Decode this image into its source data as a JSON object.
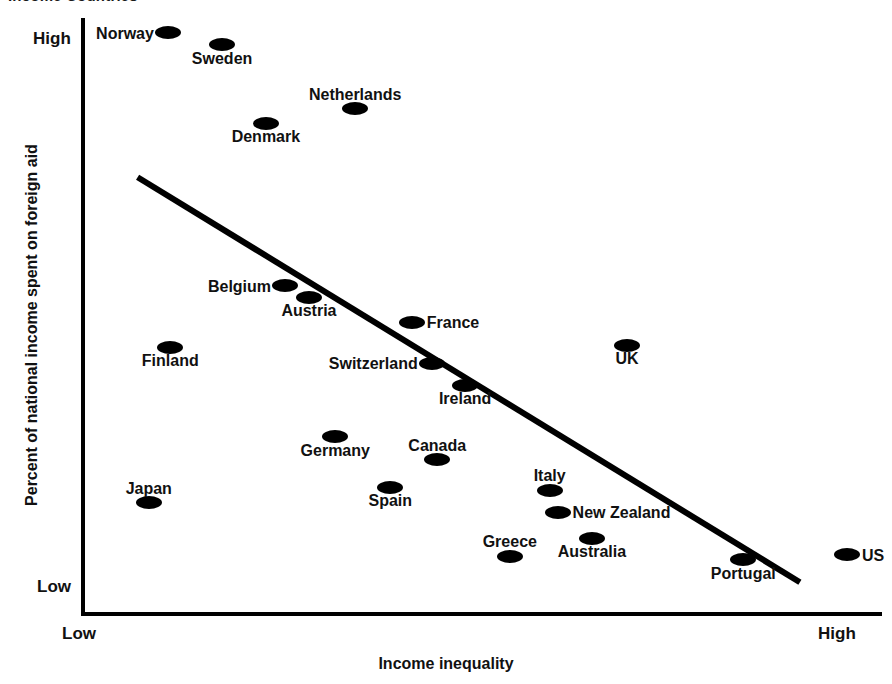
{
  "chart_data": {
    "type": "scatter",
    "title": "Income Countries",
    "xlabel": "Income inequality",
    "ylabel": "Percent of national income spent on foreign aid",
    "x_tick_labels": [
      "Low",
      "High"
    ],
    "y_tick_labels": [
      "Low",
      "High"
    ],
    "xlim": [
      0,
      100
    ],
    "ylim": [
      0,
      100
    ],
    "grid": false,
    "legend": "none",
    "marker_color": "#000000",
    "axis_color": "#000000",
    "trend_line": {
      "label": "fitted regression line",
      "color": "#000000",
      "x_start": 6.6,
      "y_start": 73.2,
      "x_end": 89.7,
      "y_end": 5.0
    },
    "points": [
      {
        "name": "Norway",
        "x": 10.4,
        "y": 97.5,
        "label_pos": "left"
      },
      {
        "name": "Sweden",
        "x": 17.2,
        "y": 95.5,
        "label_pos": "below"
      },
      {
        "name": "Netherlands",
        "x": 33.9,
        "y": 84.7,
        "label_pos": "above"
      },
      {
        "name": "Denmark",
        "x": 22.7,
        "y": 82.3,
        "label_pos": "below"
      },
      {
        "name": "Belgium",
        "x": 25.1,
        "y": 54.9,
        "label_pos": "left"
      },
      {
        "name": "Austria",
        "x": 28.1,
        "y": 53.0,
        "label_pos": "below"
      },
      {
        "name": "France",
        "x": 41.0,
        "y": 48.8,
        "label_pos": "right"
      },
      {
        "name": "Finland",
        "x": 10.7,
        "y": 44.6,
        "label_pos": "below"
      },
      {
        "name": "Switzerland",
        "x": 43.5,
        "y": 41.9,
        "label_pos": "left"
      },
      {
        "name": "Ireland",
        "x": 47.7,
        "y": 38.2,
        "label_pos": "below"
      },
      {
        "name": "UK",
        "x": 68.0,
        "y": 44.9,
        "label_pos": "below"
      },
      {
        "name": "Germany",
        "x": 31.4,
        "y": 29.5,
        "label_pos": "below"
      },
      {
        "name": "Canada",
        "x": 44.2,
        "y": 25.6,
        "label_pos": "above"
      },
      {
        "name": "Spain",
        "x": 38.3,
        "y": 21.0,
        "label_pos": "below"
      },
      {
        "name": "Japan",
        "x": 8.0,
        "y": 18.4,
        "label_pos": "above"
      },
      {
        "name": "Italy",
        "x": 58.3,
        "y": 20.5,
        "label_pos": "above"
      },
      {
        "name": "New Zealand",
        "x": 59.3,
        "y": 16.8,
        "label_pos": "right"
      },
      {
        "name": "Australia",
        "x": 63.6,
        "y": 12.4,
        "label_pos": "below"
      },
      {
        "name": "Greece",
        "x": 53.3,
        "y": 9.4,
        "label_pos": "above"
      },
      {
        "name": "Portugal",
        "x": 82.6,
        "y": 8.8,
        "label_pos": "below"
      },
      {
        "name": "US",
        "x": 95.6,
        "y": 9.6,
        "label_pos": "right"
      }
    ]
  }
}
